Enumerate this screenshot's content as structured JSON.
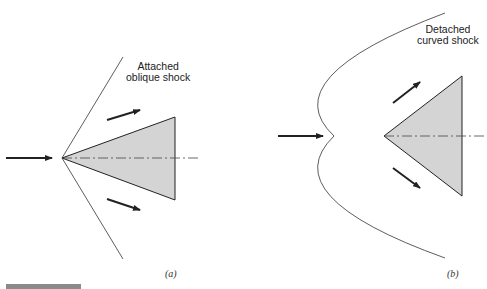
{
  "figure": {
    "panel_a": {
      "label": "Attached\noblique shock",
      "label_line1": "Attached",
      "label_line2": "oblique shock",
      "caption": "(a)"
    },
    "panel_b": {
      "label_line1": "Detached",
      "label_line2": "curved shock",
      "caption": "(b)"
    },
    "colors": {
      "wedge_fill": "#d4d4d4",
      "line": "#222222",
      "bar": "#8a8a8a"
    }
  }
}
